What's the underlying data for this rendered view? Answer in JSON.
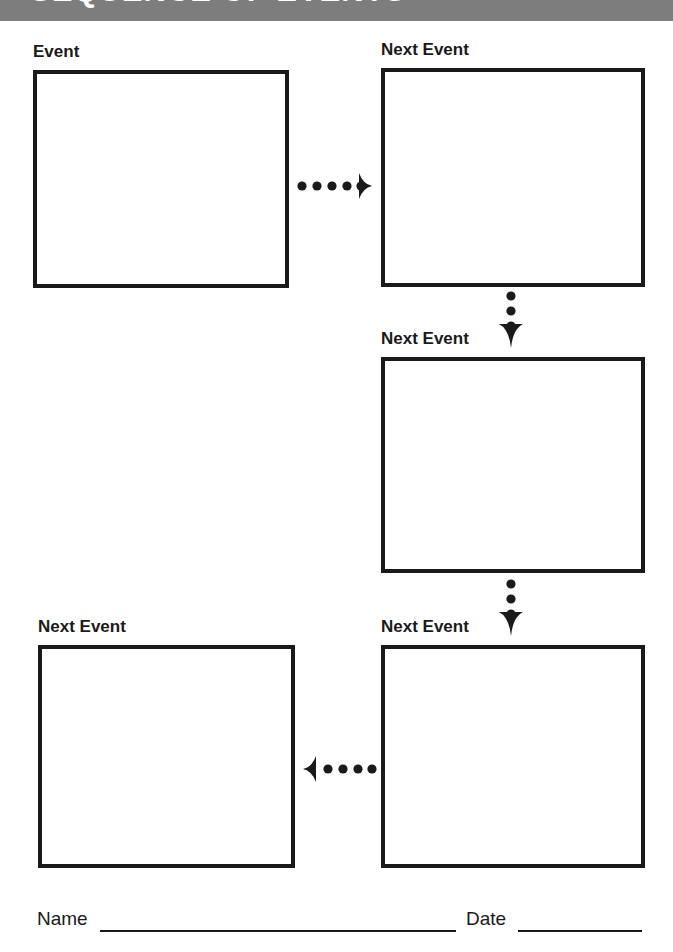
{
  "page": {
    "width": 673,
    "height": 952,
    "background_color": "#ffffff",
    "ink_color": "#1a1a1a"
  },
  "banner": {
    "title": "SEQUENCE OF EVENTS",
    "background_color": "#7d7d7d",
    "text_color": "#ffffff",
    "note": "title is cropped off the top edge of the page"
  },
  "boxes": [
    {
      "id": "event-1",
      "label": "Event",
      "value": "",
      "x": 33,
      "y": 70,
      "width": 256,
      "height": 218
    },
    {
      "id": "event-2",
      "label": "Next Event",
      "value": "",
      "x": 381,
      "y": 68,
      "width": 264,
      "height": 219
    },
    {
      "id": "event-3",
      "label": "Next Event",
      "value": "",
      "x": 381,
      "y": 357,
      "width": 264,
      "height": 216
    },
    {
      "id": "event-4",
      "label": "Next Event",
      "value": "",
      "x": 381,
      "y": 645,
      "width": 264,
      "height": 223
    },
    {
      "id": "event-5",
      "label": "Next Event",
      "value": "",
      "x": 38,
      "y": 645,
      "width": 257,
      "height": 223
    }
  ],
  "arrows": [
    {
      "id": "arrow-1-to-2",
      "direction": "right",
      "dots": 5,
      "from": "event-1",
      "to": "event-2"
    },
    {
      "id": "arrow-2-to-3",
      "direction": "down",
      "dots": 3,
      "from": "event-2",
      "to": "event-3"
    },
    {
      "id": "arrow-3-to-4",
      "direction": "down",
      "dots": 3,
      "from": "event-3",
      "to": "event-4"
    },
    {
      "id": "arrow-4-to-5",
      "direction": "left",
      "dots": 5,
      "from": "event-4",
      "to": "event-5"
    }
  ],
  "footer": {
    "name_label": "Name",
    "name_value": "",
    "date_label": "Date",
    "date_value": ""
  }
}
